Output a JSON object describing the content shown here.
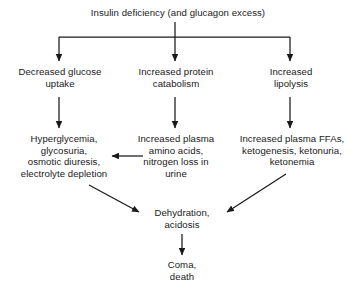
{
  "diagram": {
    "title_text": "Insulin deficiency (and glucagon excess)",
    "line_color": "#1a1a1a",
    "text_color": "#1a1a1a",
    "background_color": "#ffffff",
    "nodes": {
      "root": "Insulin deficiency (and glucagon excess)",
      "decreased_glucose_uptake": "Decreased glucose\nuptake",
      "increased_protein_catabolism": "Increased protein\ncatabolism",
      "increased_lipolysis": "Increased\nlipolysis",
      "hyperglycemia": "Hyperglycemia,\nglycosuria,\nosmotic diuresis,\nelectrolyte depletion",
      "increased_plasma_amino_acids": "Increased plasma\namino acids,\nnitrogen loss in\nurine",
      "increased_plasma_ffas": "Increased plasma FFAs,\nketogenesis, ketonuria,\nketonemia",
      "dehydration": "Dehydration,\nacidosis",
      "coma": "Coma,\ndeath"
    },
    "edges": [
      {
        "from": "root",
        "to": "decreased_glucose_uptake",
        "kind": "elbow-down-left"
      },
      {
        "from": "root",
        "to": "increased_protein_catabolism",
        "kind": "straight-down"
      },
      {
        "from": "root",
        "to": "increased_lipolysis",
        "kind": "elbow-down-right"
      },
      {
        "from": "decreased_glucose_uptake",
        "to": "hyperglycemia",
        "kind": "straight-down"
      },
      {
        "from": "increased_protein_catabolism",
        "to": "increased_plasma_amino_acids",
        "kind": "straight-down"
      },
      {
        "from": "increased_lipolysis",
        "to": "increased_plasma_ffas",
        "kind": "straight-down"
      },
      {
        "from": "increased_plasma_amino_acids",
        "to": "hyperglycemia",
        "kind": "horizontal-left"
      },
      {
        "from": "hyperglycemia",
        "to": "dehydration",
        "kind": "diagonal-down-right"
      },
      {
        "from": "increased_plasma_ffas",
        "to": "dehydration",
        "kind": "diagonal-down-left"
      },
      {
        "from": "dehydration",
        "to": "coma",
        "kind": "straight-down"
      }
    ]
  }
}
